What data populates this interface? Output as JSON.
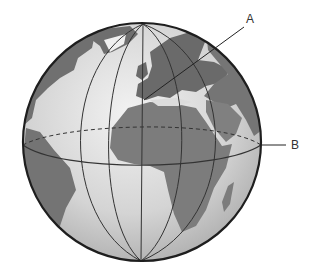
{
  "diagram": {
    "type": "globe",
    "labels": [
      {
        "id": "A",
        "text": "A",
        "points_to": "prime meridian / Europe (Greenwich area)"
      },
      {
        "id": "B",
        "text": "B",
        "points_to": "equator"
      }
    ],
    "colors": {
      "ocean": "#d6d6d6",
      "land": "#7a7a7a",
      "outline": "#222222",
      "grid": "#333333"
    }
  }
}
